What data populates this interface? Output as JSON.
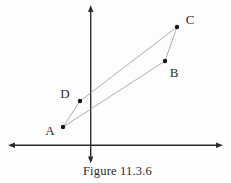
{
  "figure": {
    "caption": "Figure 11.3.6",
    "background": "#fdfdfd",
    "colors": {
      "axis": "#2b2b2b",
      "edge": "#999999",
      "point": "#161616",
      "label": "#2b2b2b"
    },
    "axes": {
      "x_axis": {
        "y": 145.3,
        "x_start": 8,
        "x_end": 223
      },
      "y_axis": {
        "x": 90.7,
        "y_start": 5,
        "y_end": 163.5
      }
    },
    "points": [
      {
        "label": "A",
        "x": 63,
        "y": 127,
        "label_x": 50,
        "label_y": 130
      },
      {
        "label": "B",
        "x": 165,
        "y": 61,
        "label_x": 174,
        "label_y": 72
      },
      {
        "label": "C",
        "x": 177,
        "y": 27,
        "label_x": 190,
        "label_y": 19
      },
      {
        "label": "D",
        "x": 80,
        "y": 101,
        "label_x": 65,
        "label_y": 93
      }
    ],
    "edges": [
      [
        "A",
        "B"
      ],
      [
        "B",
        "C"
      ],
      [
        "C",
        "D"
      ],
      [
        "D",
        "A"
      ]
    ],
    "style": {
      "axis_width": 1.4,
      "edge_width": 0.8,
      "point_radius": 2.2,
      "label_font_size": 13,
      "arrow_length": 7,
      "arrow_half_width": 2.7
    }
  }
}
